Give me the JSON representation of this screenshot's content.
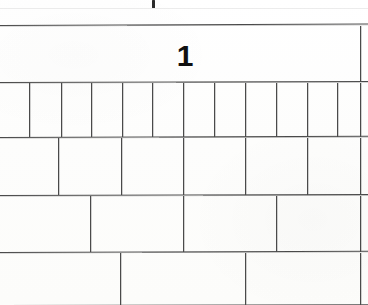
{
  "document": {
    "kind": "scanned-grid-fragment",
    "width": 368,
    "height": 305,
    "background_color": "#fdfdfc",
    "ink_color": "#4a4a4a",
    "text_color": "#101010"
  },
  "top_fragment": {
    "ink_mark_label": "cropped-ink-mark",
    "ink_mark_x": 152,
    "ink_mark_y": 0,
    "ink_mark_width": 3,
    "ink_mark_height": 8,
    "ghost_rule_y": 8
  },
  "grid": {
    "left": 0,
    "right": 360,
    "row_boundaries_y": [
      25,
      82,
      137,
      195,
      252,
      305
    ],
    "rows": [
      {
        "index": 1,
        "name": "whole-row",
        "top": 25,
        "bottom": 82,
        "cell_count": 1,
        "dividers_x": [],
        "label": "1",
        "label_font_size": 30,
        "label_x": 185,
        "label_y": 41
      },
      {
        "index": 2,
        "name": "twelfths-row",
        "top": 82,
        "bottom": 137,
        "cell_count": 12,
        "dividers_x": [
          29,
          61,
          91,
          122,
          152,
          183,
          214,
          245,
          276,
          307,
          337
        ],
        "label": ""
      },
      {
        "index": 3,
        "name": "sixths-row",
        "top": 137,
        "bottom": 195,
        "cell_count": 6,
        "dividers_x": [
          58,
          121,
          183,
          245,
          307
        ],
        "label": ""
      },
      {
        "index": 4,
        "name": "fourths-row",
        "top": 195,
        "bottom": 252,
        "cell_count": 4,
        "dividers_x": [
          90,
          183,
          276
        ],
        "label": ""
      },
      {
        "index": 5,
        "name": "thirds-row",
        "top": 252,
        "bottom": 305,
        "cell_count": 3,
        "dividers_x": [
          120,
          245
        ],
        "label": "",
        "cropped": "true"
      }
    ]
  }
}
